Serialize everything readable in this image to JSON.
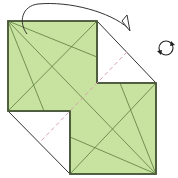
{
  "diagram": {
    "type": "origami-fold-step",
    "colors": {
      "paper_green": "#c8e3a0",
      "paper_back": "#ffffff",
      "outline": "#4a5a3a",
      "crease": "#5b7a3c",
      "dash": "#d9a0b0",
      "arrow": "#333333"
    },
    "shapes": {
      "upper_square": [
        [
          8,
          21
        ],
        [
          97,
          21
        ],
        [
          97,
          83
        ],
        [
          70,
          83
        ],
        [
          70,
          111
        ],
        [
          8,
          111
        ]
      ],
      "lower_square": [
        [
          97,
          83
        ],
        [
          156,
          83
        ],
        [
          156,
          174
        ],
        [
          70,
          174
        ],
        [
          70,
          111
        ],
        [
          97,
          111
        ]
      ],
      "top_right_flap": [
        [
          97,
          21
        ],
        [
          156,
          83
        ],
        [
          97,
          83
        ]
      ],
      "bottom_left_flap": [
        [
          8,
          111
        ],
        [
          70,
          111
        ],
        [
          70,
          174
        ]
      ]
    },
    "creases": [
      [
        [
          8,
          21
        ],
        [
          97,
          57
        ]
      ],
      [
        [
          8,
          21
        ],
        [
          44,
          111
        ]
      ],
      [
        [
          8,
          21
        ],
        [
          156,
          174
        ]
      ],
      [
        [
          97,
          21
        ],
        [
          8,
          111
        ]
      ],
      [
        [
          120,
          83
        ],
        [
          156,
          174
        ]
      ],
      [
        [
          156,
          83
        ],
        [
          70,
          174
        ]
      ],
      [
        [
          70,
          137
        ],
        [
          156,
          174
        ]
      ]
    ],
    "dashed_fold_line": [
      [
        127,
        52
      ],
      [
        40,
        142
      ]
    ],
    "fold_arrow": {
      "label": "fold-over-arrow",
      "path": "M27,34 C18,22 22,6 38,4 C70,1 110,12 128,28"
    },
    "rotate_symbol": {
      "label": "rotate-model",
      "center": [
        166,
        48
      ],
      "radius": 7
    }
  }
}
